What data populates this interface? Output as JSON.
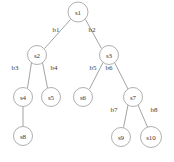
{
  "figure": {
    "type": "tree-diagram",
    "title": "",
    "background_color": "#ffffff",
    "node_stroke_color": "#9a9a9a",
    "node_fill_color": "#ffffff",
    "edge_stroke_color": "#8c8c8c",
    "text_color": "#3a3a3a",
    "width": 174,
    "height": 162
  },
  "nodes": [
    {
      "id": "s1",
      "label": "s1",
      "cx": 78,
      "cy": 12,
      "r": 10
    },
    {
      "id": "s2",
      "label": "s2",
      "cx": 37,
      "cy": 55,
      "r": 9.5
    },
    {
      "id": "s3",
      "label": "s3",
      "cx": 109,
      "cy": 55,
      "r": 9.5
    },
    {
      "id": "s4",
      "label": "s4",
      "cx": 23,
      "cy": 97,
      "r": 9.5
    },
    {
      "id": "s5",
      "label": "s5",
      "cx": 51,
      "cy": 97,
      "r": 9.5
    },
    {
      "id": "s6",
      "label": "s6",
      "cx": 83,
      "cy": 97,
      "r": 9.5
    },
    {
      "id": "s7",
      "label": "s7",
      "cx": 133,
      "cy": 97,
      "r": 9.5
    },
    {
      "id": "s8",
      "label": "s8",
      "cx": 23,
      "cy": 136,
      "r": 9.5
    },
    {
      "id": "s9",
      "label": "s9",
      "cx": 121,
      "cy": 137,
      "r": 9.5
    },
    {
      "id": "s10",
      "label": "s10",
      "cx": 151,
      "cy": 137,
      "r": 10.5
    }
  ],
  "edges": [
    {
      "id": "b1",
      "label": "b1",
      "from": "s1",
      "to": "s2",
      "label_x": 56,
      "label_y": 30
    },
    {
      "id": "b2",
      "label": "b2",
      "from": "s1",
      "to": "s3",
      "label_x": 92,
      "label_y": 30
    },
    {
      "id": "b3",
      "label": "b3",
      "from": "s2",
      "to": "s4",
      "label_x": 15,
      "label_y": 68
    },
    {
      "id": "b4",
      "label": "b4",
      "from": "s2",
      "to": "s5",
      "label_x": 54,
      "label_y": 68
    },
    {
      "id": "b5",
      "label": "b5",
      "from": "s3",
      "to": "s6",
      "label_x": 93,
      "label_y": 68
    },
    {
      "id": "b6",
      "label": "b6",
      "from": "s3",
      "to": "s7",
      "label_x": 109,
      "label_y": 68
    },
    {
      "id": "b7",
      "label": "b7",
      "from": "s7",
      "to": "s9",
      "label_x": 114,
      "label_y": 110
    },
    {
      "id": "b8",
      "label": "b8",
      "from": "s7",
      "to": "s10",
      "label_x": 154,
      "label_y": 110
    },
    {
      "id": "e-s4-s8",
      "label": "",
      "from": "s4",
      "to": "s8",
      "label_x": null,
      "label_y": null
    }
  ]
}
